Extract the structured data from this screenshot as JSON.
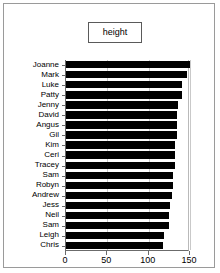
{
  "chart_data": {
    "type": "bar",
    "orientation": "horizontal",
    "title": "height",
    "legend_label": "height",
    "legend_position": "top-center",
    "xlabel": "",
    "ylabel": "",
    "xlim": [
      0,
      150
    ],
    "xticks": [
      0,
      50,
      100,
      150
    ],
    "xtick_labels": [
      "0",
      "50",
      "100",
      "150"
    ],
    "grid": true,
    "series_name": "height",
    "bar_color": "#000000",
    "categories": [
      "Joanne",
      "Mark",
      "Luke",
      "Patty",
      "Jenny",
      "David",
      "Angus",
      "Gil",
      "Kim",
      "Ceri",
      "Tracey",
      "Sam",
      "Robyn",
      "Andrew",
      "Jess",
      "Neil",
      "Sam",
      "Leigh",
      "Chris"
    ],
    "values": [
      150,
      146,
      140,
      140,
      136,
      134,
      134,
      134,
      132,
      132,
      132,
      130,
      129,
      128,
      126,
      124,
      124,
      119,
      117
    ]
  },
  "colors": {
    "frame_border": "#9a9a9a",
    "axis": "#6b6b6b",
    "gridline": "#c9c9c9",
    "bar": "#000000",
    "background": "#ffffff",
    "text": "#000000"
  }
}
